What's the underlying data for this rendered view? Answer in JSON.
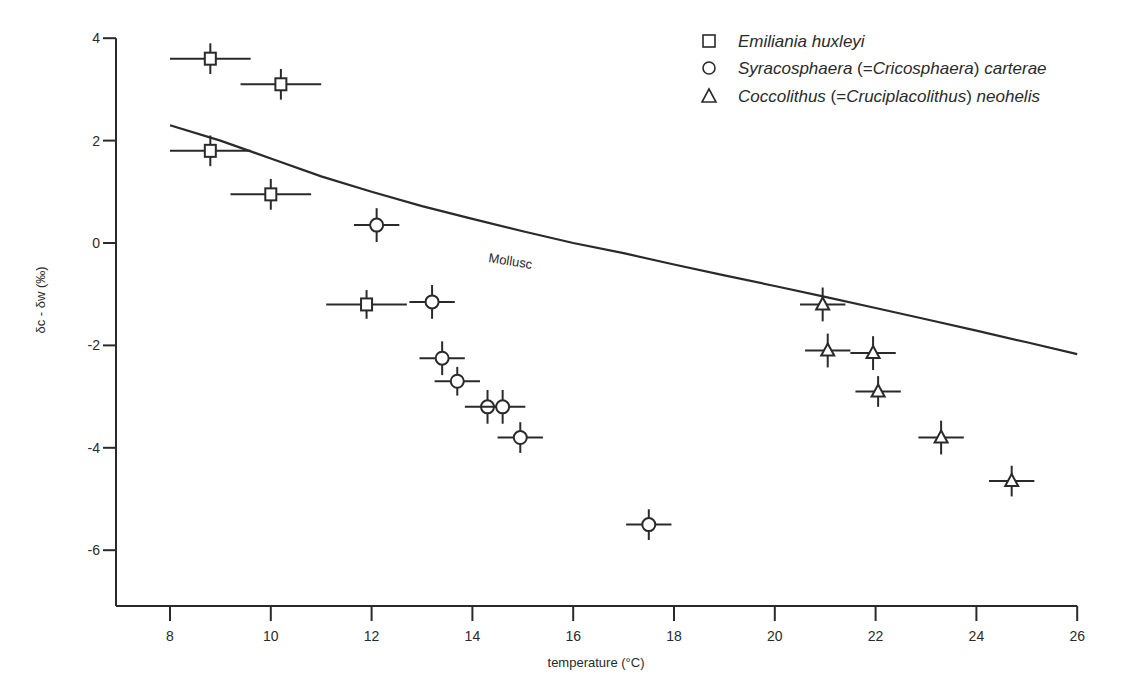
{
  "chart_data": {
    "type": "scatter",
    "title": "",
    "xlabel": "temperature (°C)",
    "ylabel": "δc - δw (‰)",
    "xlim": [
      6.9,
      26
    ],
    "ylim": [
      -7.1,
      4
    ],
    "xticks": [
      8,
      10,
      12,
      14,
      16,
      18,
      20,
      22,
      24,
      26
    ],
    "yticks": [
      4,
      2,
      0,
      -2,
      -4,
      -6
    ],
    "grid": false,
    "legend_position": "top-right",
    "series": [
      {
        "name": "Emiliania huxleyi",
        "name_parts": [
          "Emiliania huxleyi"
        ],
        "marker": "square",
        "points": [
          {
            "x": 8.8,
            "y": 3.6,
            "xerr": 0.8,
            "yerr": 0.3
          },
          {
            "x": 10.2,
            "y": 3.1,
            "xerr": 0.8,
            "yerr": 0.3
          },
          {
            "x": 8.8,
            "y": 1.8,
            "xerr": 0.8,
            "yerr": 0.3
          },
          {
            "x": 10.0,
            "y": 0.95,
            "xerr": 0.8,
            "yerr": 0.3
          },
          {
            "x": 11.9,
            "y": -1.2,
            "xerr": 0.8,
            "yerr": 0.28
          }
        ]
      },
      {
        "name": "Syracosphaera (=Cricosphaera) carterae",
        "marker": "circle",
        "points": [
          {
            "x": 12.1,
            "y": 0.35,
            "xerr": 0.45,
            "yerr": 0.33
          },
          {
            "x": 13.2,
            "y": -1.15,
            "xerr": 0.45,
            "yerr": 0.33
          },
          {
            "x": 13.4,
            "y": -2.25,
            "xerr": 0.45,
            "yerr": 0.33
          },
          {
            "x": 13.7,
            "y": -2.7,
            "xerr": 0.45,
            "yerr": 0.28
          },
          {
            "x": 14.3,
            "y": -3.2,
            "xerr": 0.45,
            "yerr": 0.33
          },
          {
            "x": 14.6,
            "y": -3.2,
            "xerr": 0.45,
            "yerr": 0.33
          },
          {
            "x": 14.95,
            "y": -3.8,
            "xerr": 0.45,
            "yerr": 0.3
          },
          {
            "x": 17.5,
            "y": -5.5,
            "xerr": 0.45,
            "yerr": 0.3
          }
        ]
      },
      {
        "name": "Coccolithus (=Cruciplacolithus) neohelis",
        "marker": "triangle",
        "points": [
          {
            "x": 20.95,
            "y": -1.2,
            "xerr": 0.45,
            "yerr": 0.33
          },
          {
            "x": 21.05,
            "y": -2.1,
            "xerr": 0.45,
            "yerr": 0.33
          },
          {
            "x": 21.95,
            "y": -2.15,
            "xerr": 0.45,
            "yerr": 0.33
          },
          {
            "x": 22.05,
            "y": -2.9,
            "xerr": 0.45,
            "yerr": 0.3
          },
          {
            "x": 23.3,
            "y": -3.8,
            "xerr": 0.45,
            "yerr": 0.33
          },
          {
            "x": 24.7,
            "y": -4.65,
            "xerr": 0.45,
            "yerr": 0.3
          }
        ]
      }
    ],
    "reference_curve": {
      "name": "Mollusc",
      "label": "Mollusc",
      "points": [
        {
          "x": 8.0,
          "y": 2.3
        },
        {
          "x": 9.0,
          "y": 2.0
        },
        {
          "x": 10.0,
          "y": 1.65
        },
        {
          "x": 11.0,
          "y": 1.3
        },
        {
          "x": 12.0,
          "y": 1.0
        },
        {
          "x": 13.0,
          "y": 0.72
        },
        {
          "x": 14.0,
          "y": 0.47
        },
        {
          "x": 15.0,
          "y": 0.23
        },
        {
          "x": 16.0,
          "y": 0.0
        },
        {
          "x": 17.0,
          "y": -0.2
        },
        {
          "x": 18.0,
          "y": -0.42
        },
        {
          "x": 19.0,
          "y": -0.63
        },
        {
          "x": 20.0,
          "y": -0.84
        },
        {
          "x": 21.0,
          "y": -1.05
        },
        {
          "x": 22.0,
          "y": -1.27
        },
        {
          "x": 23.0,
          "y": -1.49
        },
        {
          "x": 24.0,
          "y": -1.71
        },
        {
          "x": 25.0,
          "y": -1.94
        },
        {
          "x": 26.0,
          "y": -2.17
        }
      ]
    },
    "annotations": [
      {
        "text": "Mollusc",
        "x": 15.0,
        "y": -0.05
      }
    ]
  },
  "legend": {
    "items": [
      {
        "marker": "square",
        "italic1": "Emiliania huxleyi",
        "paren": "",
        "italic2": ""
      },
      {
        "marker": "circle",
        "italic1": "Syracosphaera ",
        "paren": "(=",
        "italic_mid": "Cricosphaera",
        "paren_close": ")",
        "italic2": " carterae"
      },
      {
        "marker": "triangle",
        "italic1": "Coccolithus ",
        "paren": "(=",
        "italic_mid": "Cruciplacolithus",
        "paren_close": ")",
        "italic2": " neohelis"
      }
    ]
  },
  "colors": {
    "ink": "#2a2a2a",
    "background": "#ffffff"
  }
}
